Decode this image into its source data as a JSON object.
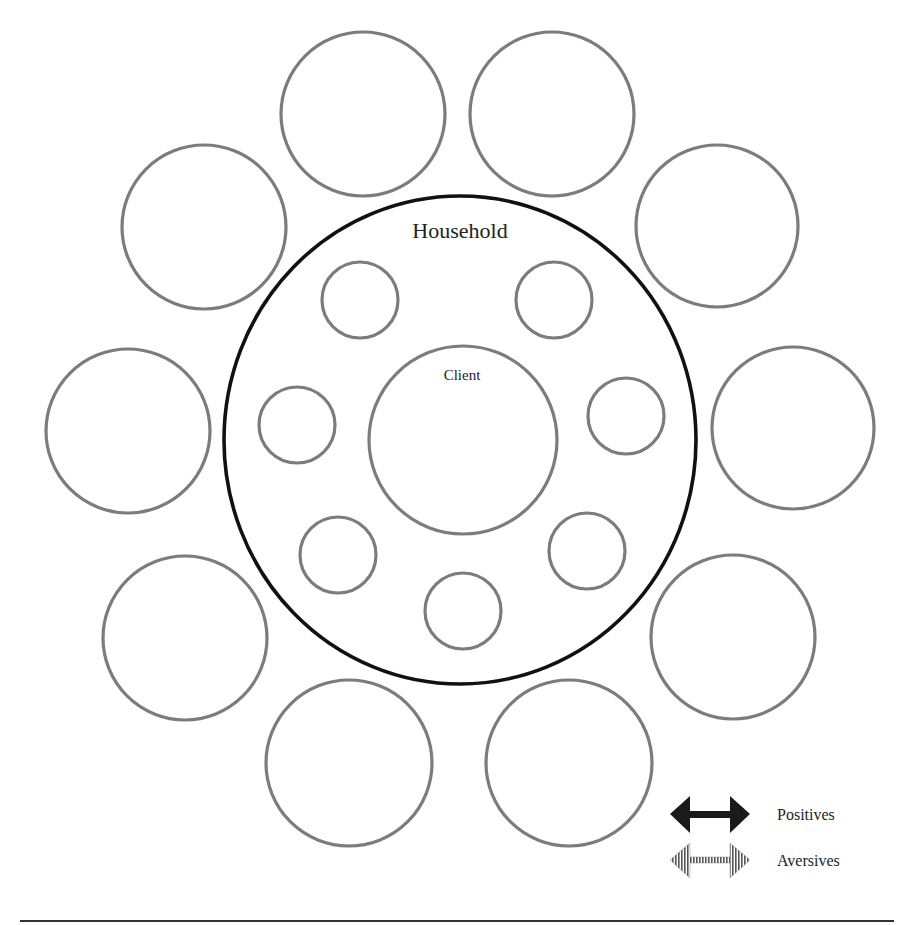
{
  "diagram": {
    "household_label": "Household",
    "client_label": "Client",
    "colors": {
      "household_stroke": "#111111",
      "circle_stroke": "#7c7c7c",
      "positive_arrow": "#1a1a1a",
      "aversive_arrow": "#555555"
    },
    "household": {
      "cx": 460,
      "cy": 440,
      "rx": 236,
      "ry": 244
    },
    "client": {
      "cx": 463,
      "cy": 440,
      "r": 94
    },
    "outer_circles": [
      {
        "cx": 363,
        "cy": 114,
        "r": 82
      },
      {
        "cx": 552,
        "cy": 114,
        "r": 82
      },
      {
        "cx": 717,
        "cy": 226,
        "r": 81
      },
      {
        "cx": 793,
        "cy": 428,
        "r": 81
      },
      {
        "cx": 733,
        "cy": 637,
        "r": 82
      },
      {
        "cx": 569,
        "cy": 763,
        "r": 83
      },
      {
        "cx": 349,
        "cy": 763,
        "r": 83
      },
      {
        "cx": 185,
        "cy": 638,
        "r": 82
      },
      {
        "cx": 128,
        "cy": 431,
        "r": 82
      },
      {
        "cx": 204,
        "cy": 227,
        "r": 82
      }
    ],
    "inner_circles": [
      {
        "cx": 360,
        "cy": 300,
        "r": 38
      },
      {
        "cx": 554,
        "cy": 300,
        "r": 38
      },
      {
        "cx": 626,
        "cy": 416,
        "r": 38
      },
      {
        "cx": 587,
        "cy": 551,
        "r": 38
      },
      {
        "cx": 463,
        "cy": 611,
        "r": 38
      },
      {
        "cx": 338,
        "cy": 555,
        "r": 38
      },
      {
        "cx": 297,
        "cy": 425,
        "r": 38
      }
    ]
  },
  "legend": {
    "items": [
      {
        "label": "Positives",
        "icon": "solid-double-arrow-icon"
      },
      {
        "label": "Aversives",
        "icon": "striped-double-arrow-icon"
      }
    ]
  }
}
